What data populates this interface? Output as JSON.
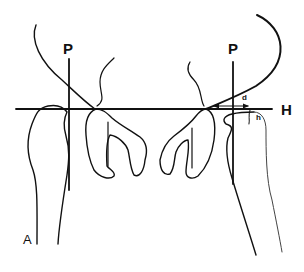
{
  "figure": {
    "panel_label": "A",
    "colors": {
      "line": "#111111",
      "thin_line": "#444444",
      "background": "#ffffff"
    },
    "reference_lines": {
      "horizontal": {
        "label": "H"
      },
      "perpendicular_left": {
        "label": "P"
      },
      "perpendicular_right": {
        "label": "P"
      }
    },
    "measurements": {
      "distance": {
        "label": "d"
      },
      "height": {
        "label": "h"
      }
    }
  }
}
